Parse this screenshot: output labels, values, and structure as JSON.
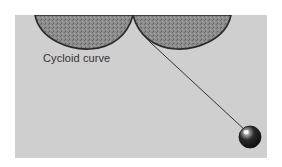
{
  "diagram": {
    "type": "cycloidal pendulum",
    "label": "Cycloid curve",
    "colors": {
      "background": "#ffffff",
      "panel": "#cfcfcf",
      "cheek_fill": "#8a8a8a",
      "outline": "#2a2a2a",
      "string": "#3a3a3a",
      "bob": "#1e1e1e"
    },
    "elements": [
      {
        "name": "left-cycloid-cheek",
        "kind": "cycloid arch"
      },
      {
        "name": "right-cycloid-cheek",
        "kind": "cycloid arch"
      },
      {
        "name": "pendulum-string",
        "kind": "line"
      },
      {
        "name": "pendulum-bob",
        "kind": "sphere"
      }
    ]
  }
}
